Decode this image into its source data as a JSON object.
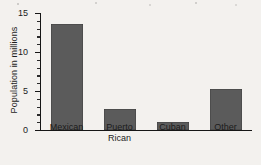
{
  "chart_data": {
    "type": "bar",
    "title": "",
    "subtitle": "",
    "xlabel": "",
    "ylabel": "Population in millions",
    "categories": [
      "Mexican",
      "Puerto\nRican",
      "Cuban",
      "Other"
    ],
    "values": [
      13.6,
      2.7,
      1.0,
      5.2
    ],
    "ylim": [
      0,
      15
    ],
    "yticks": [
      0,
      5,
      10,
      15
    ],
    "ytick_labels": [
      "0",
      "5",
      "10",
      "15"
    ],
    "minor_tick_interval": 1,
    "grid": false,
    "legend": null,
    "annotations": [],
    "colors": {
      "bar_fill": "#5b5b5b",
      "axis": "#161616",
      "text": "#1c1c1c",
      "background": "#f3f1ee"
    }
  }
}
